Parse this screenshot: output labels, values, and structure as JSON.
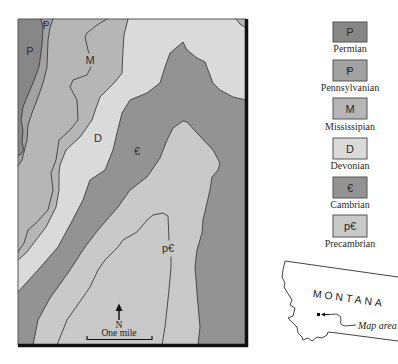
{
  "map": {
    "labels": {
      "permian": "P",
      "pennsylvanian": "Ᵽ",
      "mississippian": "M",
      "devonian": "D",
      "cambrian": "€",
      "precambrian": "p€"
    },
    "north_arrow": {
      "label": "N",
      "icon": "north-arrow-icon"
    },
    "scale_bar": {
      "label": "One mile"
    },
    "border_color": "#111111",
    "contact_color": "#3c3c3c"
  },
  "legend": {
    "items": [
      {
        "symbol": "P",
        "name": "Permian",
        "color": "#878787"
      },
      {
        "symbol": "Ᵽ",
        "name": "Pennsylvanian",
        "color": "#a2a2a2"
      },
      {
        "symbol": "M",
        "name": "Mississipian",
        "color": "#b6b6b6"
      },
      {
        "symbol": "D",
        "name": "Devonian",
        "color": "#dadada"
      },
      {
        "symbol": "€",
        "name": "Cambrian",
        "color": "#939393"
      },
      {
        "symbol": "p€",
        "name": "Precambrian",
        "color": "#c9c9c9"
      }
    ]
  },
  "inset": {
    "state_name": "MONTANA",
    "callout_label": "Map area",
    "marker_icon": "location-marker-icon"
  }
}
